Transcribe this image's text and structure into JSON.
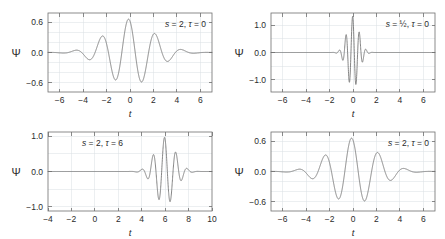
{
  "figure": {
    "width": 445,
    "height": 239,
    "background": "#ffffff",
    "curve_color": "#767676",
    "axis_color": "#6f6f6f",
    "grid_color": "#dadfe4",
    "text_color": "#2b2b2b"
  },
  "chart_data": [
    {
      "id": "panel-top-left",
      "type": "line",
      "title": "",
      "annotation": "s = 2, τ = 0",
      "annotation_parts": {
        "s_symbol": "s",
        "s_value": "2",
        "tau_symbol": "τ",
        "tau_value": "0"
      },
      "xlabel": "t",
      "ylabel": "Ψ",
      "xlim": [
        -7,
        7
      ],
      "ylim": [
        -0.78,
        0.78
      ],
      "xticks": [
        -6,
        -4,
        -2,
        0,
        2,
        4,
        6
      ],
      "xticklabels": [
        "−6",
        "−4",
        "−2",
        "0",
        "2",
        "4",
        "6"
      ],
      "yticks": [
        -0.6,
        0.0,
        0.6
      ],
      "yticklabels": [
        "−0.6",
        "0.0",
        "0.6"
      ],
      "ygrid": [
        -0.6,
        -0.4,
        -0.2,
        0.0,
        0.2,
        0.4,
        0.6
      ],
      "xgrid": [
        -6,
        -4,
        -2,
        0,
        2,
        4,
        6
      ],
      "grid": true,
      "legend": "none",
      "wavelet": {
        "s": 2.0,
        "tau": 0.0,
        "omega": 5.5,
        "amplitude": 0.66,
        "phase": 0.35
      }
    },
    {
      "id": "panel-top-right",
      "type": "line",
      "title": "",
      "annotation": "s = ½, τ = 0",
      "annotation_parts": {
        "s_symbol": "s",
        "s_value": "½",
        "tau_symbol": "τ",
        "tau_value": "0"
      },
      "xlabel": "t",
      "ylabel": "Ψ",
      "xlim": [
        -7,
        7
      ],
      "ylim": [
        -1.45,
        1.45
      ],
      "xticks": [
        -6,
        -4,
        -2,
        0,
        2,
        4,
        6
      ],
      "xticklabels": [
        "−6",
        "−4",
        "−2",
        "0",
        "2",
        "4",
        "6"
      ],
      "yticks": [
        -1.0,
        0.0,
        1.0
      ],
      "yticklabels": [
        "−1.0",
        "0.0",
        "1.0"
      ],
      "ygrid": [
        -1.0,
        -0.5,
        0.0,
        0.5,
        1.0
      ],
      "xgrid": [
        -6,
        -4,
        -2,
        0,
        2,
        4,
        6
      ],
      "grid": true,
      "legend": "none",
      "wavelet": {
        "s": 0.5,
        "tau": 0.0,
        "omega": 5.5,
        "amplitude": 1.33,
        "phase": 0.35
      }
    },
    {
      "id": "panel-bottom-left",
      "type": "line",
      "title": "",
      "annotation": "s = 2, τ = 6",
      "annotation_parts": {
        "s_symbol": "s",
        "s_value": "2",
        "tau_symbol": "τ",
        "tau_value": "6"
      },
      "xlabel": "t",
      "ylabel": "Ψ",
      "xlim": [
        -4,
        10
      ],
      "ylim": [
        -1.12,
        1.12
      ],
      "xticks": [
        -4,
        -2,
        0,
        2,
        4,
        6,
        8,
        10
      ],
      "xticklabels": [
        "−4",
        "−2",
        "0",
        "2",
        "4",
        "6",
        "8",
        "10"
      ],
      "yticks": [
        -1.0,
        0.0,
        1.0
      ],
      "yticklabels": [
        "−1.0",
        "0.0",
        "1.0"
      ],
      "ygrid": [
        -1.0,
        -0.5,
        0.0,
        0.5,
        1.0
      ],
      "xgrid": [
        -4,
        -2,
        0,
        2,
        4,
        6,
        8,
        10
      ],
      "grid": true,
      "legend": "none",
      "wavelet": {
        "s": 0.85,
        "tau": 6.0,
        "omega": 5.5,
        "amplitude": 0.97,
        "phase": 0.35
      }
    },
    {
      "id": "panel-bottom-right",
      "type": "line",
      "title": "",
      "annotation": "s = 2, τ = 0",
      "annotation_parts": {
        "s_symbol": "s",
        "s_value": "2",
        "tau_symbol": "τ",
        "tau_value": "0"
      },
      "xlabel": "t",
      "ylabel": "Ψ",
      "xlim": [
        -7,
        7
      ],
      "ylim": [
        -0.78,
        0.78
      ],
      "xticks": [
        -6,
        -4,
        -2,
        0,
        2,
        4,
        6
      ],
      "xticklabels": [
        "−6",
        "−4",
        "−2",
        "0",
        "2",
        "4",
        "6"
      ],
      "yticks": [
        -0.6,
        0.0,
        0.6
      ],
      "yticklabels": [
        "−0.6",
        "0.0",
        "0.6"
      ],
      "ygrid": [
        -0.6,
        -0.4,
        -0.2,
        0.0,
        0.2,
        0.4,
        0.6
      ],
      "xgrid": [
        -6,
        -4,
        -2,
        0,
        2,
        4,
        6
      ],
      "grid": true,
      "legend": "none",
      "wavelet": {
        "s": 2.0,
        "tau": 0.0,
        "omega": 5.5,
        "amplitude": 0.66,
        "phase": 0.35
      }
    }
  ]
}
